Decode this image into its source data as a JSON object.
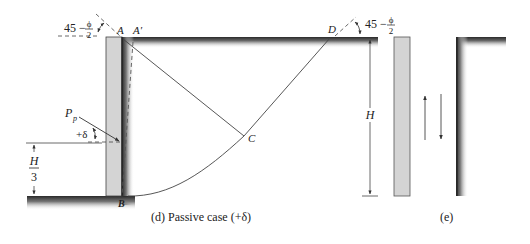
{
  "figure": {
    "panel_d": {
      "caption": "(d) Passive case (+δ)",
      "labels": {
        "angle_left_num": "45 −",
        "angle_left_frac_num": "ϕ",
        "angle_left_frac_den": "2",
        "point_A": "A",
        "point_A_prime": "A′",
        "point_B": "B",
        "point_C": "C",
        "point_D": "D",
        "force": "P",
        "force_sub": "p",
        "delta": "+δ",
        "height_frac_num": "H",
        "height_frac_den": "3",
        "height": "H",
        "angle_right_num": "45 −",
        "angle_right_frac_num": "ϕ",
        "angle_right_frac_den": "2"
      }
    },
    "panel_e": {
      "caption": "(e)"
    },
    "colors": {
      "wall_fill": "#d4d4d4",
      "soil_dark": "#3a3a3a",
      "line": "#444444"
    }
  }
}
